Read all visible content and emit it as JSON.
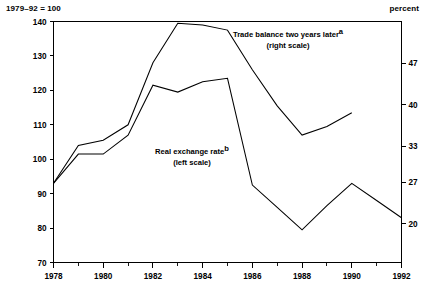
{
  "header": {
    "index_note": "1979–92 = 100",
    "unit_note": "percent"
  },
  "chart_data": {
    "type": "line",
    "title": "",
    "subtitle": "",
    "xlabel": "",
    "ylabel": "1979–92 = 100",
    "y2label": "percent",
    "grid": false,
    "legend_position": "inline-annotation",
    "x": [
      1978,
      1979,
      1980,
      1981,
      1982,
      1983,
      1984,
      1985,
      1986,
      1987,
      1988,
      1989,
      1990,
      1991,
      1992
    ],
    "xlim": [
      1978,
      1992
    ],
    "x_tick_labels": [
      "1978",
      "1980",
      "1982",
      "1984",
      "1986",
      "1988",
      "1990",
      "1992"
    ],
    "x_major_ticks": [
      1978,
      1980,
      1982,
      1984,
      1986,
      1988,
      1990,
      1992
    ],
    "x_minor_ticks": [
      1979,
      1981,
      1983,
      1985,
      1987,
      1989,
      1991
    ],
    "ylim": [
      70,
      140
    ],
    "y_ticks": [
      70,
      80,
      90,
      100,
      110,
      120,
      130,
      140
    ],
    "y_tick_labels": [
      "70",
      "80",
      "90",
      "100",
      "110",
      "120",
      "130",
      "140"
    ],
    "y2_ticks": [
      20,
      27,
      33,
      40,
      47
    ],
    "y2_tick_labels": [
      "20",
      "27",
      "33",
      "40",
      "47"
    ],
    "y2_lim": [
      13.5,
      54.0
    ],
    "series": [
      {
        "name": "Trade balance two years later",
        "footnote": "a",
        "label_line1": "Trade balance two years later",
        "label_line2": "(right scale)",
        "scale": "right",
        "axis": "y2",
        "color": "#000000",
        "x": [
          1978,
          1979,
          1980,
          1981,
          1982,
          1983,
          1984,
          1985,
          1986,
          1987,
          1988,
          1989,
          1990
        ],
        "values_left_scale": [
          93.0,
          104.0,
          105.5,
          110.0,
          128.0,
          139.5,
          139.0,
          137.5,
          126.0,
          115.5,
          107.0,
          109.5,
          113.5
        ],
        "values": [
          26.9,
          33.3,
          34.2,
          36.8,
          47.2,
          53.7,
          53.5,
          52.6,
          46.0,
          39.9,
          35.0,
          36.4,
          38.7
        ]
      },
      {
        "name": "Real exchange rate",
        "footnote": "b",
        "label_line1": "Real exchange rate",
        "label_line2": "(left scale)",
        "scale": "left",
        "axis": "y1",
        "color": "#000000",
        "x": [
          1978,
          1979,
          1980,
          1981,
          1982,
          1983,
          1984,
          1985,
          1986,
          1987,
          1988,
          1989,
          1990,
          1991,
          1992
        ],
        "values": [
          93.0,
          101.5,
          101.5,
          107.0,
          121.5,
          119.5,
          122.5,
          123.5,
          92.5,
          86.0,
          79.5,
          86.5,
          93.0,
          88.0,
          83.0
        ]
      }
    ]
  }
}
